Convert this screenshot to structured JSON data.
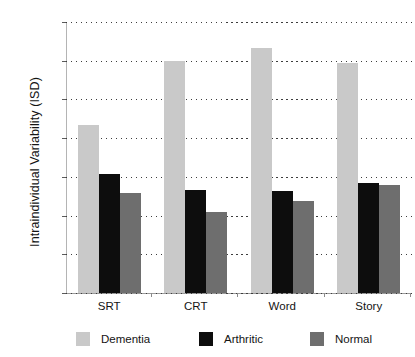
{
  "chart_data": {
    "type": "bar",
    "title": "",
    "subtitle": "",
    "xlabel": "",
    "ylabel": "Intraindividual Variability (ISD)",
    "categories": [
      "SRT",
      "CRT",
      "Word",
      "Story"
    ],
    "series": [
      {
        "name": "Dementia",
        "color": "#c9c9c9",
        "values": [
          8.7,
          12.0,
          12.65,
          11.9
        ]
      },
      {
        "name": "Arthritic",
        "color": "#0d0d0d",
        "values": [
          6.15,
          5.3,
          5.28,
          5.68
        ]
      },
      {
        "name": "Normal",
        "color": "#6e6e6e",
        "values": [
          5.15,
          4.2,
          4.75,
          5.58
        ]
      }
    ],
    "ylim": [
      0,
      14
    ],
    "yticks": [
      0,
      2,
      4,
      6,
      8,
      10,
      12,
      14
    ],
    "ytick_labels": [
      "0",
      "2",
      "4",
      "6",
      "8",
      "10",
      "12",
      "14"
    ],
    "grid": "horizontal-dotted",
    "legend_position": "bottom",
    "legend_entries": [
      "Dementia",
      "Arthritic",
      "Normal"
    ],
    "annotations": []
  }
}
